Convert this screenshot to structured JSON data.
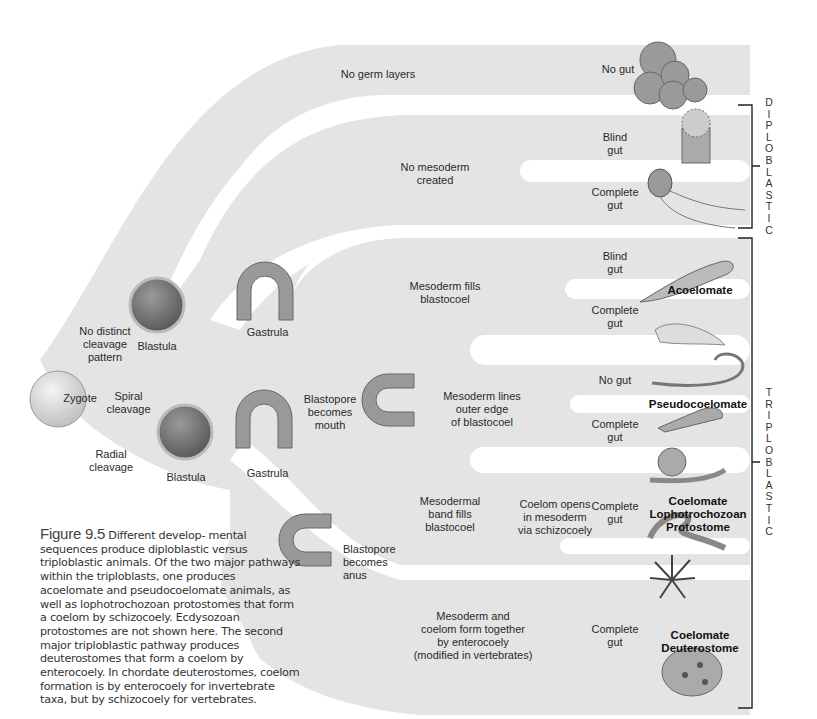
{
  "figure": {
    "number": "Figure 9.5",
    "caption_first": "Different develop-",
    "caption_rest": "mental sequences produce diploblastic versus triploblastic animals. Of the two major pathways within the triploblasts, one produces acoelomate and pseudocoelomate animals, as well as lophotrochozoan protostomes that form a coelom by schizocoely. Ecdysozoan protostomes are not shown here. The second major triploblastic pathway produces deuterostomes that form a coelom by enterocoely. In chordate deuterostomes, coelom formation is by enterocoely for invertebrate taxa, but by schizocoely for vertebrates."
  },
  "start": {
    "label": "Zygote"
  },
  "cleavage": {
    "none": "No distinct\ncleavage\npattern",
    "spiral": "Spiral\ncleavage",
    "radial": "Radial\ncleavage"
  },
  "stages": {
    "blastula_top": "Blastula",
    "gastrula_top": "Gastrula",
    "blastula_bottom": "Blastula",
    "gastrula_bottom": "Gastrula",
    "blastopore_mouth": "Blastopore\nbecomes\nmouth",
    "blastopore_anus": "Blastopore\nbecomes anus"
  },
  "branches": {
    "no_germ_layers": "No germ layers",
    "no_mesoderm": "No mesoderm\ncreated",
    "mesoderm_fills": "Mesoderm fills\nblastocoel",
    "mesoderm_lines": "Mesoderm lines\nouter edge\nof blastocoel",
    "mesodermal_band": "Mesodermal\nband fills\nblastocoel",
    "coelom_opens": "Coelom opens\nin mesoderm\nvia schizocoely",
    "enterocoely": "Mesoderm and\ncoelom form together\nby enterocoely\n(modified in vertebrates)"
  },
  "gut_labels": {
    "sponge": "No gut",
    "anemone": "Blind\ngut",
    "ctenophore": "Complete\ngut",
    "flatworm": "Blind\ngut",
    "nemertean": "Complete\ngut",
    "nematode": "No gut",
    "rotifer": "Complete\ngut",
    "coelomate_proto": "Complete\ngut",
    "deutero": "Complete\ngut"
  },
  "groups": {
    "acoelomate": "Acoelomate",
    "pseudocoelomate": "Pseudocoelomate",
    "lophotrochozoan": "Coelomate\nLophotrochozoan\nProtostome",
    "deuterostome": "Coelomate\nDeuterostome"
  },
  "brackets": {
    "diploblastic": [
      "D",
      "I",
      "P",
      "L",
      "O",
      "B",
      "L",
      "A",
      "S",
      "T",
      "I",
      "C"
    ],
    "triploblastic": [
      "T",
      "R",
      "I",
      "P",
      "L",
      "O",
      "B",
      "L",
      "A",
      "S",
      "T",
      "I",
      "C"
    ]
  },
  "colors": {
    "band": "#e3e3e3",
    "band_dark": "#d9d9d9",
    "embryo_fill": "#8a8a8a",
    "bracket": "#222222"
  }
}
